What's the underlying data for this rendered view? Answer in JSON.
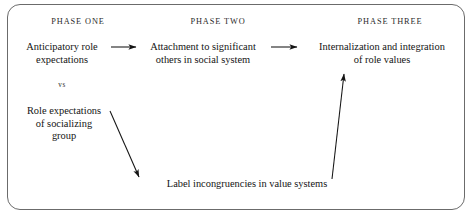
{
  "figure": {
    "background_color": "#ffffff",
    "frame_color": "#6b6b6b",
    "text_color": "#141414"
  },
  "headers": {
    "phase_one": "PHASE ONE",
    "phase_two": "PHASE TWO",
    "phase_three": "PHASE THREE"
  },
  "nodes": {
    "anticipatory": "Anticipatory role\nexpectations",
    "vs": "vs",
    "role_expectations": "Role expectations\nof socializing\ngroup",
    "attachment": "Attachment to significant\nothers in social system",
    "internalization": "Internalization and integration\nof role values",
    "label_incongruencies": "Label incongruencies in value systems"
  },
  "arrows": [
    {
      "name": "arrow-anticipatory-to-attachment",
      "from": "anticipatory",
      "to": "attachment",
      "direction": "right",
      "x1": 111,
      "y1": 47,
      "x2": 136,
      "y2": 47
    },
    {
      "name": "arrow-attachment-to-internalization",
      "from": "attachment",
      "to": "internalization",
      "direction": "right",
      "x1": 271,
      "y1": 47,
      "x2": 297,
      "y2": 47
    },
    {
      "name": "arrow-role-expectations-to-label",
      "from": "role_expectations",
      "to": "label_incongruencies",
      "direction": "down-right",
      "x1": 110,
      "y1": 111,
      "x2": 139,
      "y2": 177
    },
    {
      "name": "arrow-label-to-internalization",
      "from": "label_incongruencies",
      "to": "internalization",
      "direction": "up",
      "x1": 332,
      "y1": 179,
      "x2": 344,
      "y2": 74
    }
  ]
}
